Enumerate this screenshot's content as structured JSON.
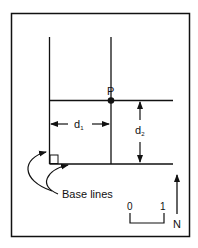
{
  "diagram": {
    "point_label": "P",
    "distance_1_label": "d",
    "distance_1_sub": "1",
    "distance_2_label": "d",
    "distance_2_sub": "2",
    "base_lines_label": "Base lines",
    "scale_start": "0",
    "scale_end": "1",
    "north_label": "N",
    "colors": {
      "stroke": "#111111",
      "background": "#ffffff"
    }
  }
}
